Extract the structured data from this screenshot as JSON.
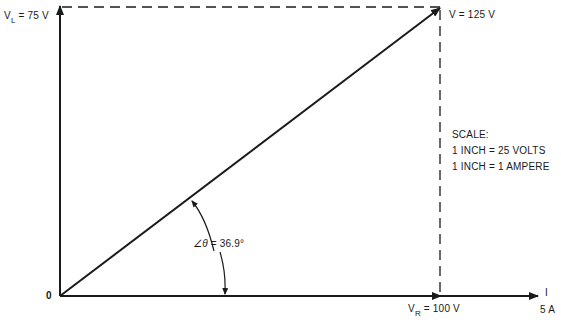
{
  "diagram": {
    "type": "phasor-diagram",
    "vertical_label": {
      "symbol": "V",
      "subscript": "L",
      "value": "= 75 V"
    },
    "resultant_label": "V = 125 V",
    "horizontal_label": {
      "symbol": "V",
      "subscript": "R",
      "value": "= 100 V"
    },
    "origin_label": "0",
    "current_label": {
      "symbol": "I",
      "value": "5 A"
    },
    "angle_label": {
      "symbol": "∠θ",
      "value": "= 36.9°"
    },
    "scale": {
      "title": "SCALE:",
      "lines": [
        "1 INCH = 25 VOLTS",
        "1 INCH = 1 AMPERE"
      ]
    },
    "colors": {
      "line": "#1a1a1a",
      "background": "#ffffff"
    }
  }
}
